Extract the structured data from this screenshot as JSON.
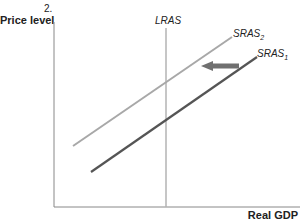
{
  "figure": {
    "number_label": "2.",
    "y_axis_label": "Price level",
    "x_axis_label": "Real GDP"
  },
  "curves": {
    "lras": {
      "label": "LRAS",
      "color": "#b3b3b3"
    },
    "sras2": {
      "label": "SRAS",
      "subscript": "2",
      "color": "#a8a8a8"
    },
    "sras1": {
      "label": "SRAS",
      "subscript": "1",
      "color": "#555555"
    }
  },
  "arrow": {
    "direction": "left",
    "meaning": "SRAS shifts from SRAS1 to SRAS2",
    "color": "#707070"
  },
  "colors": {
    "axis": "#888888",
    "text": "#222222"
  }
}
